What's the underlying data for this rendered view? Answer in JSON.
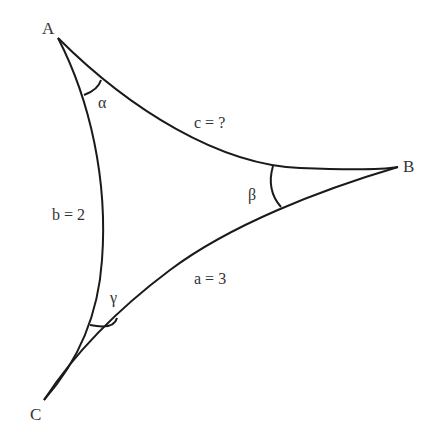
{
  "diagram": {
    "vertices": {
      "A": {
        "label": "A",
        "x": 58,
        "y": 38
      },
      "B": {
        "label": "B",
        "x": 398,
        "y": 167
      },
      "C": {
        "label": "C",
        "x": 44,
        "y": 400
      }
    },
    "sides": {
      "a": {
        "label": "a = 3",
        "between": "B-C"
      },
      "b": {
        "label": "b = 2",
        "between": "A-C"
      },
      "c": {
        "label": "c = ?",
        "between": "A-B"
      }
    },
    "angles": {
      "alpha": {
        "label": "α",
        "vertex": "A"
      },
      "beta": {
        "label": "β",
        "vertex": "B"
      },
      "gamma": {
        "label": "γ",
        "vertex": "C"
      }
    },
    "colors": {
      "stroke": "#1a1a1a",
      "text": "#333333",
      "background": "#ffffff"
    }
  }
}
